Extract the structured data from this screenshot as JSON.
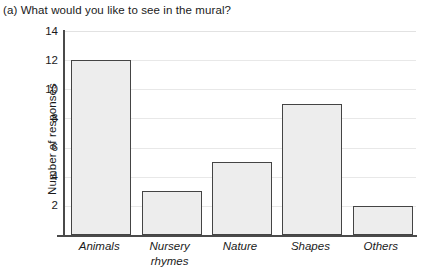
{
  "chart_data": {
    "type": "bar",
    "title": "(a) What would you like to see in the mural?",
    "xlabel": "",
    "ylabel": "Number of responses",
    "categories": [
      "Animals",
      "Nursery rhymes",
      "Nature",
      "Shapes",
      "Others"
    ],
    "values": [
      12,
      3,
      5,
      9,
      2
    ],
    "ylim": [
      0,
      14
    ],
    "ytick_labels": [
      "2",
      "4",
      "6",
      "8",
      "10",
      "12",
      "14"
    ],
    "ytick_values": [
      2,
      4,
      6,
      8,
      10,
      12,
      14
    ],
    "grid": true,
    "legend": "none",
    "bar_fill_color": "#ededed",
    "bar_border_color": "#444444",
    "gridline_color": "#e8e8e8",
    "axis_color": "#4a4a4a"
  },
  "labels": {
    "category_lines": [
      [
        "Animals"
      ],
      [
        "Nursery",
        "rhymes"
      ],
      [
        "Nature"
      ],
      [
        "Shapes"
      ],
      [
        "Others"
      ]
    ]
  }
}
